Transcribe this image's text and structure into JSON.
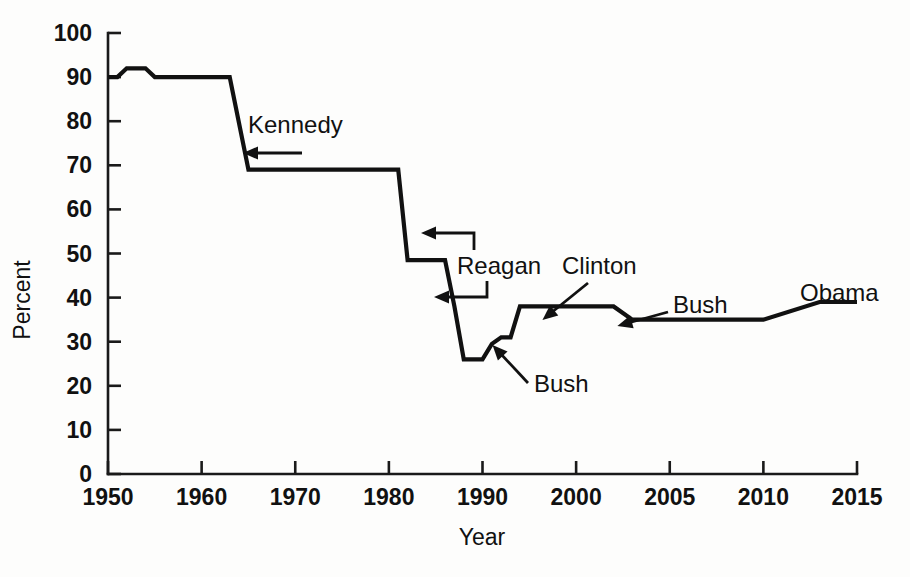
{
  "chart_data": {
    "type": "line",
    "title": "",
    "subtitle": "",
    "xlabel": "Year",
    "ylabel": "Percent",
    "ylim": [
      0,
      100
    ],
    "xlim": [
      1950,
      2015
    ],
    "grid": false,
    "legend": "none",
    "y_ticks": [
      0,
      10,
      20,
      30,
      40,
      50,
      60,
      70,
      80,
      90,
      100
    ],
    "y_tick_labels": [
      "0",
      "10",
      "20",
      "30",
      "40",
      "50",
      "60",
      "70",
      "80",
      "90",
      "100"
    ],
    "x_ticks": [
      1950,
      1960,
      1970,
      1980,
      1990,
      2000,
      2005,
      2010,
      2015
    ],
    "x_tick_labels": [
      "1950",
      "1960",
      "1970",
      "1980",
      "1990",
      "2000",
      "2005",
      "2010",
      "2015"
    ],
    "x_axis_note": "non-uniform spacing: equal pixel width for each decade 1950-2000 and each 5-year step 2000-2015",
    "series": [
      {
        "name": "Top marginal income tax rate",
        "color": "#111111",
        "x": [
          1950,
          1951,
          1952,
          1954,
          1955,
          1963,
          1965,
          1981,
          1982,
          1986,
          1987,
          1988,
          1990,
          1991,
          1992,
          1993,
          1994,
          2002,
          2003,
          2010,
          2013,
          2015
        ],
        "values": [
          90,
          90,
          92,
          92,
          90,
          90,
          69,
          69,
          48.5,
          48.5,
          38,
          26,
          26,
          29.5,
          31,
          31,
          38,
          38,
          35,
          35,
          39,
          39
        ]
      }
    ],
    "annotations": [
      {
        "id": "kennedy",
        "label": "Kennedy",
        "label_x": 248,
        "label_y": 133,
        "arrow_from_x": 302,
        "arrow_from_y": 153,
        "arrow_to_x": 254,
        "arrow_to_y": 153,
        "style": "straight"
      },
      {
        "id": "reagan",
        "label": "Reagan",
        "label_x": 457,
        "label_y": 274,
        "arrow1": "elbow-up-left",
        "arrow2": "elbow-down-left"
      },
      {
        "id": "clinton",
        "label": "Clinton",
        "label_x": 562,
        "label_y": 274,
        "arrow_from_x": 588,
        "arrow_from_y": 283,
        "arrow_to_x": 551,
        "arrow_to_y": 313,
        "style": "straight"
      },
      {
        "id": "bush-lower",
        "label": "Bush",
        "label_x": 534,
        "label_y": 392,
        "arrow_from_x": 528,
        "arrow_from_y": 383,
        "arrow_to_x": 500,
        "arrow_to_y": 353,
        "style": "straight"
      },
      {
        "id": "bush-upper",
        "label": "Bush",
        "label_x": 673,
        "label_y": 313,
        "arrow_from_x": 668,
        "arrow_from_y": 312,
        "arrow_to_x": 628,
        "arrow_to_y": 323,
        "style": "straight"
      },
      {
        "id": "obama",
        "label": "Obama",
        "label_x": 800,
        "label_y": 301,
        "style": "none"
      }
    ]
  },
  "axes": {
    "y_title": "Percent",
    "x_title": "Year"
  },
  "colors": {
    "line": "#111111",
    "axis": "#1a1a1a",
    "background": "#fdfdfc",
    "text": "#111111"
  }
}
